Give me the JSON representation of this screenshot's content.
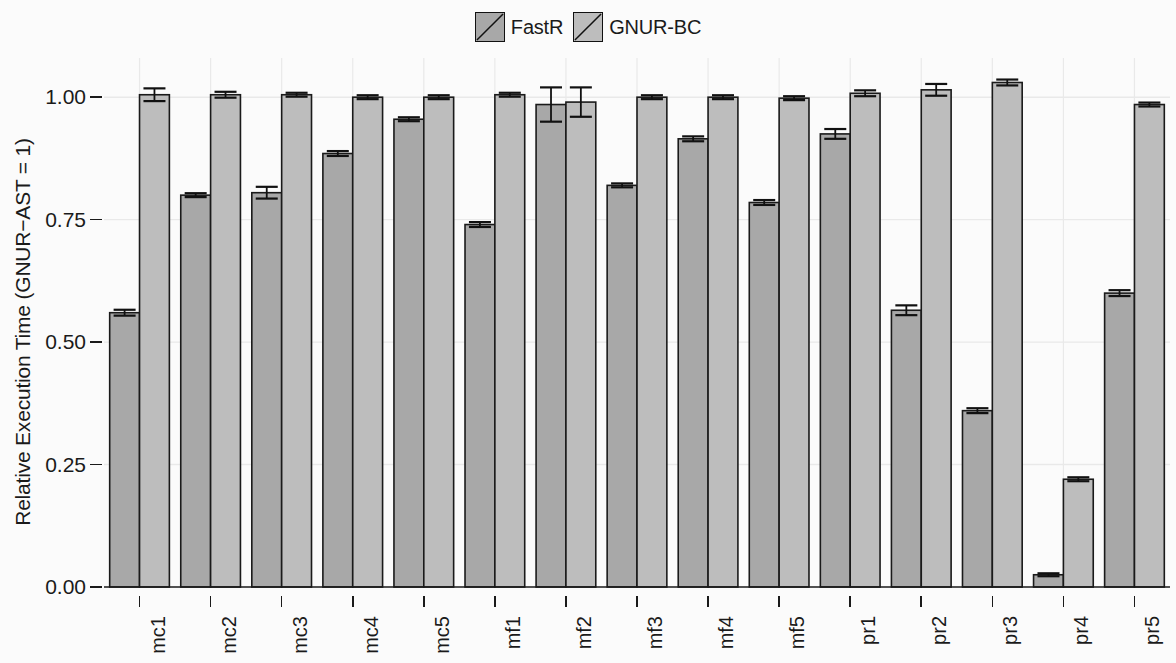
{
  "legend": {
    "position": "top-center",
    "entries": [
      {
        "label": "FastR",
        "color": "#a8a8a8",
        "icon": "hatched-square-icon"
      },
      {
        "label": "GNUR-BC",
        "color": "#bdbdbd",
        "icon": "hatched-square-icon"
      }
    ]
  },
  "axes": {
    "ylabel": "Relative Execution Time (GNUR−AST = 1)",
    "xlabel": "",
    "yticks": [
      "0.00",
      "0.25",
      "0.50",
      "0.75",
      "1.00"
    ],
    "ytick_values": [
      0.0,
      0.25,
      0.5,
      0.75,
      1.0
    ],
    "ylim": [
      0.0,
      1.08
    ],
    "grid": true
  },
  "colors": {
    "bar_fastr": "#a8a8a8",
    "bar_gnur_bc": "#bdbdbd",
    "bar_outline": "#1a1a1a",
    "grid": "#e9e9e9",
    "axis": "#1a1a1a",
    "background": "#fbfbfb",
    "error_bar": "#111111"
  },
  "chart_data": {
    "type": "bar",
    "title": "",
    "xlabel": "",
    "ylabel": "Relative Execution Time (GNUR−AST = 1)",
    "ylim": [
      0.0,
      1.08
    ],
    "grid": true,
    "legend_position": "top-center",
    "categories": [
      "mc1",
      "mc2",
      "mc3",
      "mc4",
      "mc5",
      "mf1",
      "mf2",
      "mf3",
      "mf4",
      "mf5",
      "pr1",
      "pr2",
      "pr3",
      "pr4",
      "pr5"
    ],
    "series": [
      {
        "name": "FastR",
        "color": "#a8a8a8",
        "values": [
          0.56,
          0.8,
          0.805,
          0.885,
          0.955,
          0.74,
          0.985,
          0.82,
          0.915,
          0.785,
          0.925,
          0.565,
          0.36,
          0.025,
          0.6
        ],
        "errors": [
          0.006,
          0.004,
          0.012,
          0.005,
          0.004,
          0.005,
          0.035,
          0.004,
          0.005,
          0.005,
          0.01,
          0.01,
          0.005,
          0.003,
          0.006
        ]
      },
      {
        "name": "GNUR-BC",
        "color": "#bdbdbd",
        "values": [
          1.005,
          1.005,
          1.005,
          1.0,
          1.0,
          1.005,
          0.99,
          1.0,
          1.0,
          0.998,
          1.008,
          1.015,
          1.03,
          0.22,
          0.985
        ],
        "errors": [
          0.013,
          0.006,
          0.004,
          0.004,
          0.004,
          0.004,
          0.03,
          0.004,
          0.004,
          0.004,
          0.006,
          0.012,
          0.006,
          0.004,
          0.004
        ]
      }
    ]
  }
}
